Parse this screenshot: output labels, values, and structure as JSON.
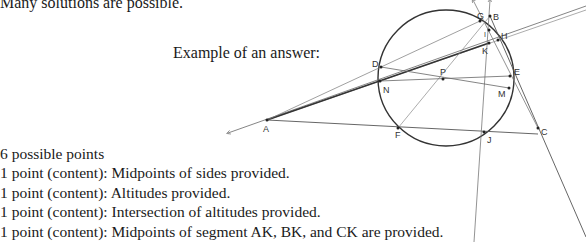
{
  "header": {
    "note": "Many solutions are possible.",
    "example_label": "Example of an answer:"
  },
  "scoring": {
    "total": "6 possible points",
    "items": [
      "1 point (content): Midpoints of sides provided.",
      "1 point (content): Altitudes provided.",
      "1 point (content): Intersection of altitudes provided.",
      "1 point (content): Midpoints of segment AK, BK, and CK are provided."
    ]
  },
  "figure": {
    "points": [
      {
        "label": "A",
        "x": 267,
        "y": 120
      },
      {
        "label": "B",
        "x": 490,
        "y": 16
      },
      {
        "label": "C",
        "x": 538,
        "y": 124
      },
      {
        "label": "D",
        "x": 381,
        "y": 67
      },
      {
        "label": "E",
        "x": 510,
        "y": 76
      },
      {
        "label": "F",
        "x": 398,
        "y": 128
      },
      {
        "label": "G",
        "x": 480,
        "y": 21
      },
      {
        "label": "H",
        "x": 498,
        "y": 40
      },
      {
        "label": "J",
        "x": 484,
        "y": 132
      },
      {
        "label": "K",
        "x": 489,
        "y": 43
      },
      {
        "label": "M",
        "x": 509,
        "y": 88
      },
      {
        "label": "N",
        "x": 380,
        "y": 81
      },
      {
        "label": "P",
        "x": 443,
        "y": 79
      },
      {
        "label": "I",
        "x": 489,
        "y": 30
      }
    ],
    "circle": {
      "cx": 446,
      "cy": 78,
      "r": 68
    }
  }
}
